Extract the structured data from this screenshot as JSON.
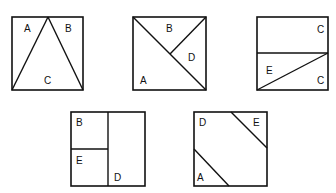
{
  "figure": {
    "type": "square dissection puzzle pieces",
    "squares": [
      {
        "id": "square-1",
        "labels": [
          {
            "text": "A",
            "x": 27,
            "y": 32
          },
          {
            "text": "B",
            "x": 68,
            "y": 32
          },
          {
            "text": "C",
            "x": 47,
            "y": 84
          }
        ]
      },
      {
        "id": "square-2",
        "labels": [
          {
            "text": "B",
            "x": 170,
            "y": 32
          },
          {
            "text": "D",
            "x": 191,
            "y": 60
          },
          {
            "text": "A",
            "x": 143,
            "y": 84
          }
        ]
      },
      {
        "id": "square-3",
        "labels": [
          {
            "text": "C",
            "x": 320,
            "y": 33
          },
          {
            "text": "E",
            "x": 269,
            "y": 74
          },
          {
            "text": "C",
            "x": 320,
            "y": 84
          }
        ]
      },
      {
        "id": "square-4",
        "labels": [
          {
            "text": "B",
            "x": 79,
            "y": 126
          },
          {
            "text": "E",
            "x": 79,
            "y": 164
          },
          {
            "text": "D",
            "x": 117,
            "y": 181
          }
        ]
      },
      {
        "id": "square-5",
        "labels": [
          {
            "text": "D",
            "x": 202,
            "y": 126
          },
          {
            "text": "E",
            "x": 256,
            "y": 126
          },
          {
            "text": "A",
            "x": 200,
            "y": 181
          }
        ]
      }
    ]
  }
}
